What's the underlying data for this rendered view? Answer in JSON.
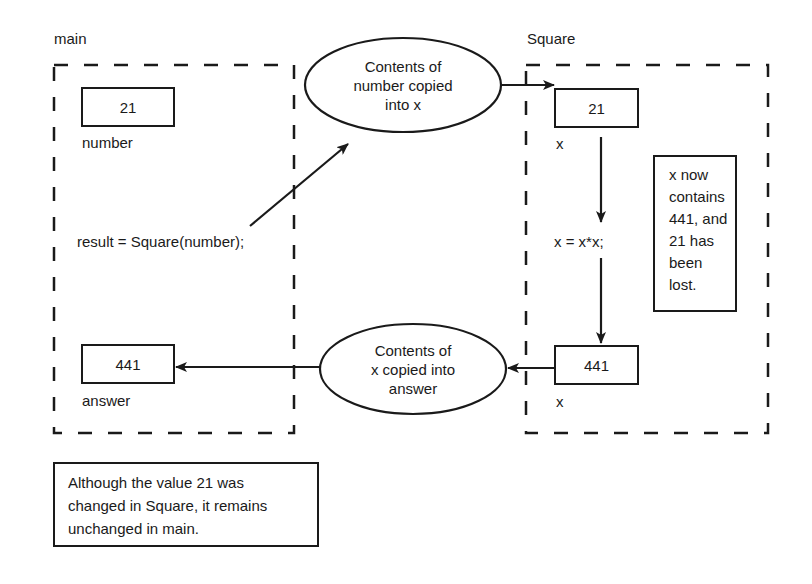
{
  "regions": {
    "main": {
      "label": "main"
    },
    "square": {
      "label": "Square"
    }
  },
  "main": {
    "number_box": {
      "value": "21",
      "label": "number"
    },
    "call_statement": "result = Square(number);",
    "answer_box": {
      "value": "441",
      "label": "answer"
    }
  },
  "square": {
    "x_initial": {
      "value": "21",
      "label": "x"
    },
    "statement": "x = x*x;",
    "x_final": {
      "value": "441",
      "label": "x"
    },
    "note_lines": [
      "x now",
      "contains",
      "441, and",
      "21 has",
      "been",
      "lost."
    ]
  },
  "ellipses": {
    "copy_in": {
      "lines": [
        "Contents of",
        "number copied",
        "into x"
      ]
    },
    "copy_out": {
      "lines": [
        "Contents of",
        "x copied into",
        "answer"
      ]
    }
  },
  "caption": {
    "lines": [
      "Although the value 21 was",
      "changed in Square, it remains",
      "unchanged in main."
    ]
  },
  "colors": {
    "ink": "#1a1a1a",
    "background": "#ffffff"
  }
}
